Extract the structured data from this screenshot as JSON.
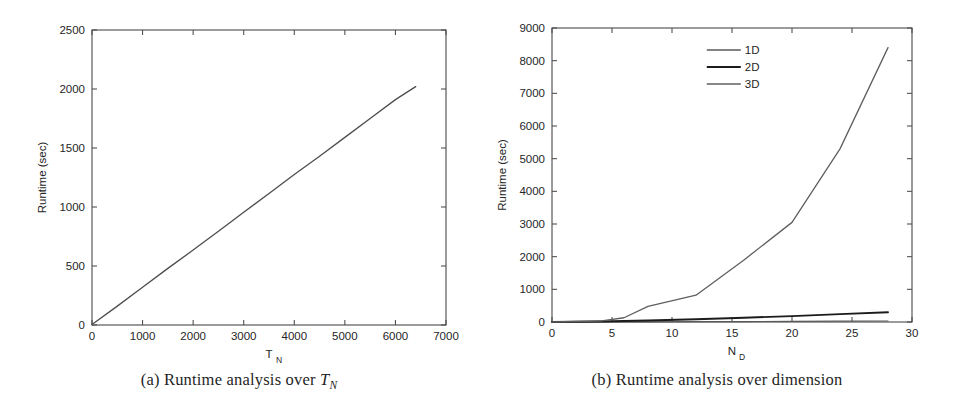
{
  "figure": {
    "background": "#ffffff",
    "panels": [
      {
        "id": "panel-a",
        "caption_prefix": "(a)",
        "caption_text": "Runtime analysis over",
        "caption_math_base": "T",
        "caption_math_sub": "N"
      },
      {
        "id": "panel-b",
        "caption_prefix": "(b)",
        "caption_text": "Runtime analysis over dimension",
        "caption_math_base": "",
        "caption_math_sub": ""
      }
    ]
  },
  "chart_data": [
    {
      "type": "line",
      "id": "runtime-vs-tn",
      "title": "",
      "xlabel": "T_N",
      "xlabel_base": "T",
      "xlabel_sub": "N",
      "ylabel": "Runtime (sec)",
      "xlim": [
        0,
        7000
      ],
      "ylim": [
        0,
        2500
      ],
      "xticks": [
        0,
        1000,
        2000,
        3000,
        4000,
        5000,
        6000,
        7000
      ],
      "xtick_labels": [
        "0",
        "1000",
        "2000",
        "3000",
        "4000",
        "5000",
        "6000",
        "7000"
      ],
      "yticks": [
        0,
        500,
        1000,
        1500,
        2000,
        2500
      ],
      "ytick_labels": [
        "0",
        "500",
        "1000",
        "1500",
        "2000",
        "2500"
      ],
      "grid": false,
      "legend": false,
      "series": [
        {
          "name": "runtime",
          "color": "#4d4d4d",
          "width": 1.3,
          "x": [
            0,
            500,
            1000,
            1500,
            2000,
            2500,
            3000,
            3500,
            4000,
            4500,
            5000,
            5500,
            6000,
            6400
          ],
          "values": [
            5,
            160,
            320,
            480,
            635,
            795,
            955,
            1115,
            1275,
            1430,
            1590,
            1750,
            1910,
            2020
          ]
        }
      ]
    },
    {
      "type": "line",
      "id": "runtime-vs-dimension",
      "title": "",
      "xlabel": "N_D",
      "xlabel_base": "N",
      "xlabel_sub": "D",
      "ylabel": "Runtime (sec)",
      "xlim": [
        0,
        30
      ],
      "ylim": [
        0,
        9000
      ],
      "xticks": [
        0,
        5,
        10,
        15,
        20,
        25,
        30
      ],
      "xtick_labels": [
        "0",
        "5",
        "10",
        "15",
        "20",
        "25",
        "30"
      ],
      "yticks": [
        0,
        1000,
        2000,
        3000,
        4000,
        5000,
        6000,
        7000,
        8000,
        9000
      ],
      "ytick_labels": [
        "0",
        "1000",
        "2000",
        "3000",
        "4000",
        "5000",
        "6000",
        "7000",
        "8000",
        "9000"
      ],
      "grid": false,
      "legend": true,
      "legend_position": "top-center",
      "legend_entries": [
        "1D",
        "2D",
        "3D"
      ],
      "series": [
        {
          "name": "1D",
          "color": "#5a5a5a",
          "width": 1.2,
          "x": [
            0,
            4,
            8,
            12,
            16,
            20,
            24,
            28
          ],
          "values": [
            0,
            2,
            5,
            9,
            13,
            18,
            24,
            30
          ]
        },
        {
          "name": "2D",
          "color": "#1c1c1c",
          "width": 1.9,
          "x": [
            0,
            4,
            8,
            12,
            16,
            20,
            24,
            28
          ],
          "values": [
            0,
            15,
            45,
            85,
            130,
            180,
            240,
            300
          ]
        },
        {
          "name": "3D",
          "color": "#5f5f5f",
          "width": 1.3,
          "x": [
            0,
            4,
            6,
            8,
            12,
            16,
            20,
            24,
            28
          ],
          "values": [
            0,
            30,
            130,
            480,
            820,
            1900,
            3050,
            5300,
            8400
          ]
        }
      ]
    }
  ]
}
